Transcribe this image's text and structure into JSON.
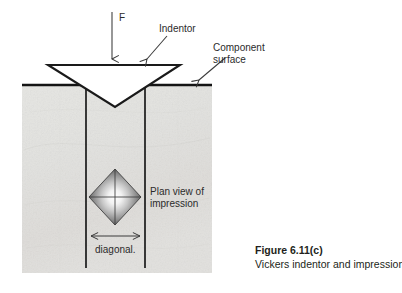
{
  "figure": {
    "canvas": {
      "width": 402,
      "height": 293,
      "background": "#ffffff"
    },
    "labels": {
      "force": "F",
      "indentor": "Indentor",
      "component_surface_line1": "Component",
      "component_surface_line2": "surface",
      "plan_view_line1": "Plan view of",
      "plan_view_line2": "impression",
      "diagonal": "diagonal."
    },
    "caption": {
      "title": "Figure 6.11(c)",
      "text": "Vickers indentor and impression."
    },
    "colors": {
      "ink": "#231f20",
      "label_text": "#2b2b2b",
      "specimen_fill": "#e4e4e1",
      "specimen_fill_alt": "#dedbd8",
      "indentor_fill": "#ffffff",
      "impression_edge": "#4a4a4a",
      "impression_center": "#ffffff",
      "arrow_stroke": "#3a3a3a"
    },
    "geometry": {
      "surface_line_y": 85,
      "specimen_left": 22,
      "specimen_right": 212,
      "specimen_bottom": 273,
      "indentor_top_y": 65,
      "indentor_left_x": 48,
      "indentor_right_x": 180,
      "indentor_apex_x": 115,
      "indentor_apex_y": 107,
      "well_left_x": 86,
      "well_right_x": 145,
      "well_bottom_y": 268,
      "impression_center_x": 115,
      "impression_center_y": 197,
      "impression_half_width": 26,
      "impression_half_height": 28,
      "diagonal_arrow_y": 236,
      "diagonal_arrow_x1": 90,
      "diagonal_arrow_x2": 141,
      "force_arrow_x": 112,
      "force_arrow_y1": 12,
      "force_arrow_y2": 62
    }
  }
}
